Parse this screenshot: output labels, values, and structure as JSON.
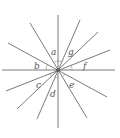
{
  "diagram": {
    "title": "",
    "colors": {
      "line": "#6b6b6b",
      "label": "#555555",
      "background": "#ffffff"
    },
    "labels": [
      "a",
      "b",
      "c",
      "d",
      "e",
      "f",
      "g"
    ]
  }
}
